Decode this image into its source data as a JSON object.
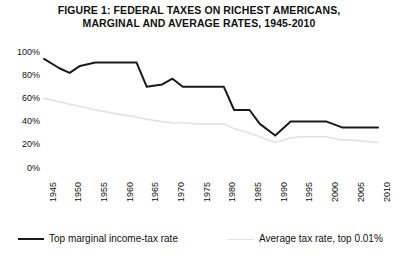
{
  "figure": {
    "title": "FIGURE 1: FEDERAL TAXES ON RICHEST AMERICANS,\nMARGINAL AND AVERAGE RATES, 1945-2010",
    "background": "#ffffff"
  },
  "colors": {
    "marginal_line": "#1a1a1a",
    "average_line": "#e2e2e2",
    "text": "#111111"
  },
  "legend": {
    "position": "bottom",
    "entries": [
      {
        "label": "Top marginal income-tax rate",
        "color": "#1a1a1a",
        "width": 2.0
      },
      {
        "label": "Average tax rate, top 0.01%",
        "color": "#e2e2e2",
        "width": 1.6
      }
    ]
  },
  "axes": {
    "y_ticks": [
      "100%",
      "80%",
      "60%",
      "40%",
      "20%",
      "0%"
    ],
    "x_ticks": [
      "1945",
      "1950",
      "1955",
      "1960",
      "1965",
      "1970",
      "1975",
      "1980",
      "1985",
      "1990",
      "1995",
      "2000",
      "2005",
      "2010"
    ]
  },
  "chart_data": {
    "type": "line",
    "title": "FIGURE 1: FEDERAL TAXES ON RICHEST AMERICANS, MARGINAL AND AVERAGE RATES, 1945-2010",
    "xlabel": "",
    "ylabel": "",
    "xlim": [
      1945,
      2010
    ],
    "ylim": [
      0,
      100
    ],
    "grid": false,
    "legend_position": "bottom",
    "xticks": [
      1945,
      1950,
      1955,
      1960,
      1965,
      1970,
      1975,
      1980,
      1985,
      1990,
      1995,
      2000,
      2005,
      2010
    ],
    "yticks": [
      0,
      20,
      40,
      60,
      80,
      100
    ],
    "ytick_labels": [
      "0%",
      "20%",
      "40%",
      "60%",
      "80%",
      "100%"
    ],
    "x": [
      1945,
      1948,
      1950,
      1952,
      1955,
      1960,
      1963,
      1965,
      1968,
      1970,
      1972,
      1975,
      1978,
      1980,
      1982,
      1985,
      1987,
      1990,
      1993,
      1995,
      2000,
      2003,
      2005,
      2010
    ],
    "series": [
      {
        "name": "Top marginal income-tax rate",
        "color": "#1a1a1a",
        "values": [
          94,
          86,
          82,
          88,
          91,
          91,
          91,
          70,
          72,
          77,
          70,
          70,
          70,
          70,
          50,
          50,
          38,
          28,
          40,
          40,
          40,
          35,
          35,
          35
        ]
      },
      {
        "name": "Average tax rate, top 0.01%",
        "color": "#e2e2e2",
        "values": [
          60,
          57,
          55,
          53,
          50,
          46,
          44,
          42,
          40,
          39,
          39,
          38,
          38,
          38,
          34,
          30,
          27,
          22,
          26,
          27,
          27,
          24,
          24,
          22
        ]
      }
    ]
  }
}
